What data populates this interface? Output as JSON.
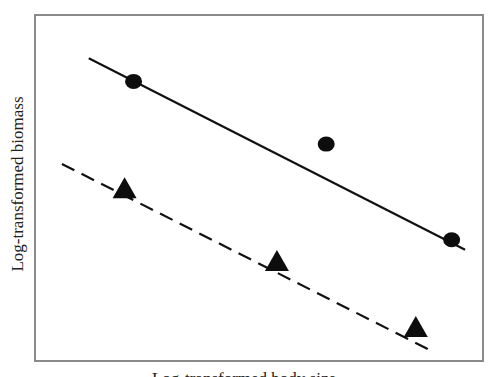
{
  "chart_data": {
    "type": "scatter",
    "title": "",
    "xlabel": "Log-transformed body size",
    "ylabel": "Log-transformed biomass",
    "grid": false,
    "legend": null,
    "axis_ticks": "none",
    "series": [
      {
        "name": "circles",
        "marker": "circle",
        "line_style": "solid",
        "points": [
          [
            0.22,
            0.82
          ],
          [
            0.65,
            0.63
          ],
          [
            0.93,
            0.34
          ]
        ],
        "fit_line": {
          "x": [
            0.12,
            0.96
          ],
          "y": [
            0.89,
            0.31
          ]
        }
      },
      {
        "name": "triangles",
        "marker": "triangle",
        "line_style": "dashed",
        "points": [
          [
            0.2,
            0.49
          ],
          [
            0.54,
            0.27
          ],
          [
            0.85,
            0.07
          ]
        ],
        "fit_line": {
          "x": [
            0.06,
            0.89
          ],
          "y": [
            0.57,
            0.0
          ]
        }
      }
    ],
    "xlim": [
      0,
      1
    ],
    "ylim": [
      0,
      1
    ]
  },
  "labels": {
    "y": "Log-transformed biomass",
    "x": "Log-transformed body size"
  }
}
